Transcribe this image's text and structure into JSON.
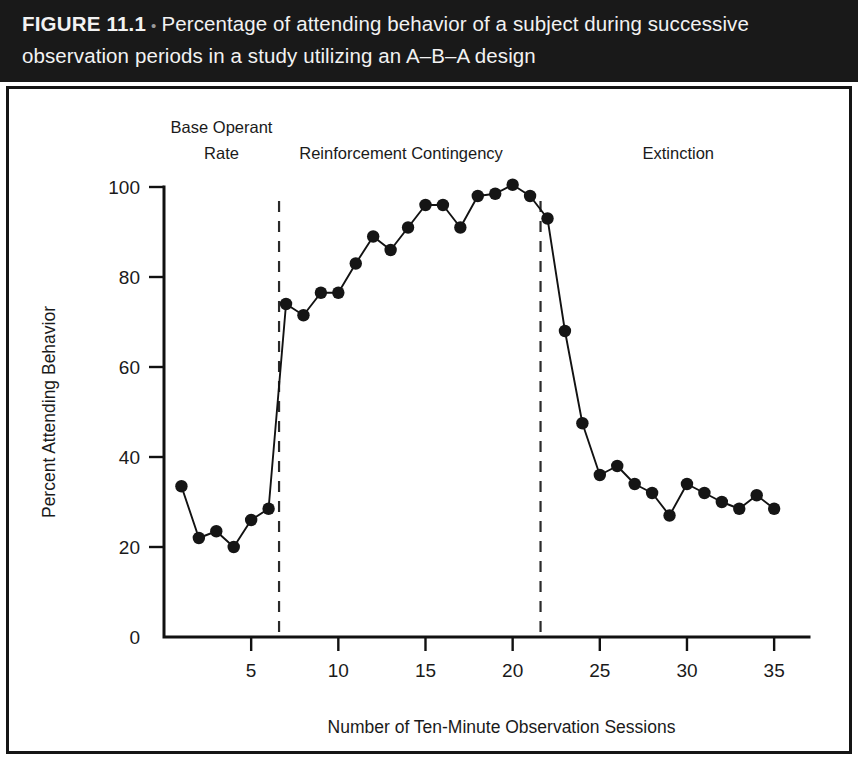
{
  "caption": {
    "figure_number": "FIGURE 11.1",
    "bullet": "•",
    "text": "Percentage of attending behavior of a subject during successive observation periods in a study utilizing an A–B–A design",
    "band_color": "#191919",
    "text_color": "#f2f2f2"
  },
  "chart_data": {
    "type": "line",
    "title": "",
    "xlabel": "Number of Ten-Minute Observation Sessions",
    "ylabel": "Percent Attending Behavior",
    "xlim": [
      0,
      37
    ],
    "ylim": [
      0,
      105
    ],
    "grid": false,
    "legend": "none",
    "marker": "filled-circle",
    "line_color": "#121212",
    "marker_color": "#151515",
    "xticks": [
      5,
      10,
      15,
      20,
      25,
      30,
      35
    ],
    "xtick_labels": [
      "5",
      "10",
      "15",
      "20",
      "25",
      "30",
      "35"
    ],
    "yticks": [
      0,
      20,
      40,
      60,
      80,
      100
    ],
    "ytick_labels": [
      "0",
      "20",
      "40",
      "60",
      "80",
      "100"
    ],
    "x": [
      1,
      2,
      3,
      4,
      5,
      6,
      7,
      8,
      9,
      10,
      11,
      12,
      13,
      14,
      15,
      16,
      17,
      18,
      19,
      20,
      21,
      22,
      23,
      24,
      25,
      26,
      27,
      28,
      29,
      30,
      31,
      32,
      33,
      34,
      35
    ],
    "values": [
      33.5,
      22,
      23.5,
      20,
      26,
      28.5,
      74,
      71.5,
      76.5,
      76.5,
      83,
      89,
      86,
      91,
      96,
      96,
      91,
      98,
      98.5,
      100.5,
      98,
      93,
      68,
      47.5,
      36,
      38,
      34,
      32,
      27,
      34,
      32,
      30,
      28.5,
      31.5,
      28.5
    ],
    "phase_dividers": [
      6.6,
      21.6
    ],
    "phase_labels": [
      {
        "label_line1": "Base Operant",
        "label_line2": "Rate",
        "center_x": 3.3
      },
      {
        "label_line1": "Reinforcement Contingency",
        "label_line2": "",
        "center_x": 13.6
      },
      {
        "label_line1": "Extinction",
        "label_line2": "",
        "center_x": 29.5
      }
    ]
  }
}
